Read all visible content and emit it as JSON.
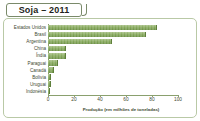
{
  "chart_data": {
    "type": "bar",
    "orientation": "horizontal",
    "title": "Soja – 2011",
    "xlabel": "Produção (em milhões de toneladas)",
    "ylabel": "",
    "xlim": [
      0,
      100
    ],
    "xticks": [
      0,
      20,
      40,
      60,
      80,
      100
    ],
    "grid": false,
    "legend": null,
    "categories": [
      "Estados Unidos",
      "Brasil",
      "Argentina",
      "China",
      "Índia",
      "Paraguai",
      "Canadá",
      "Bolívia",
      "Uruguai",
      "Indonésia"
    ],
    "values": [
      84,
      75,
      49,
      14,
      14,
      8,
      4.5,
      2.5,
      2,
      1
    ],
    "bar_color": "#86a95c",
    "bar_edge_color": "#5f7f3c",
    "axis_color": "#8aa06e",
    "text_color": "#3f4a32",
    "panel_border_color": "#b9c9a6",
    "background_color": "#ffffff"
  }
}
